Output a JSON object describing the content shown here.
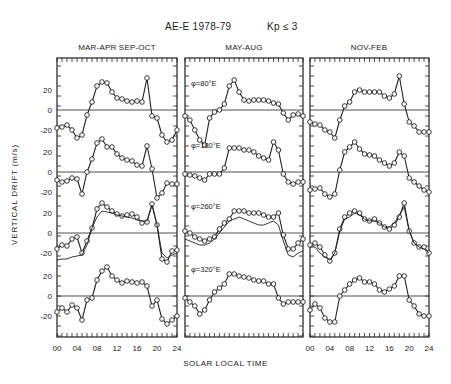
{
  "header": {
    "title_left": "AE-E 1978-79",
    "title_right": "Kp ≤ 3"
  },
  "axes": {
    "ylabel": "VERTICAL DRIFT (m/s)",
    "xlabel": "SOLAR LOCAL TIME",
    "x_ticks": [
      "00",
      "04",
      "08",
      "12",
      "16",
      "20",
      "24"
    ],
    "y_ticks": [
      "20",
      "0",
      "-20"
    ]
  },
  "chart_data": {
    "type": "line",
    "xlabel": "SOLAR LOCAL TIME",
    "ylabel": "VERTICAL DRIFT (m/s)",
    "x": [
      0,
      1,
      2,
      3,
      4,
      5,
      6,
      7,
      8,
      9,
      10,
      11,
      12,
      13,
      14,
      15,
      16,
      17,
      18,
      19,
      20,
      21,
      22,
      23,
      24
    ],
    "xlim": [
      0,
      24
    ],
    "grid": false,
    "layout": "3 columns (seasons) x 4 stacked traces (longitude sectors), each trace with its own zero line",
    "longitudes": [
      "φ=80°E",
      "φ=180°E",
      "φ=260°E",
      "φ=320°E"
    ],
    "panels": [
      {
        "season": "MAR-APR SEP-OCT",
        "series": [
          {
            "name": "φ=80°E",
            "values": [
              -18,
              -17,
              -15,
              -20,
              -28,
              -25,
              -5,
              8,
              24,
              28,
              27,
              18,
              12,
              11,
              9,
              8,
              9,
              8,
              32,
              -6,
              -8,
              -25,
              -32,
              -30,
              -20
            ]
          },
          {
            "name": "φ=180°E",
            "values": [
              -8,
              -10,
              -9,
              -6,
              -7,
              -22,
              0,
              13,
              29,
              33,
              25,
              25,
              18,
              14,
              12,
              11,
              7,
              6,
              26,
              3,
              -26,
              -21,
              -11,
              -12,
              -12
            ]
          },
          {
            "name": "φ=260°E",
            "values": [
              -16,
              -12,
              -13,
              -6,
              -4,
              -20,
              -8,
              5,
              24,
              30,
              26,
              22,
              19,
              17,
              18,
              19,
              16,
              10,
              11,
              29,
              8,
              -26,
              -29,
              -18,
              -17
            ]
          },
          {
            "name": "φ=260°E (model)",
            "values": [
              -27,
              -26,
              -26,
              -24,
              -23,
              -22,
              -12,
              5,
              16,
              22,
              21,
              20,
              18,
              17,
              16,
              15,
              13,
              12,
              12,
              28,
              8,
              -20,
              -25,
              -22,
              -20
            ]
          },
          {
            "name": "φ=320°E",
            "values": [
              -16,
              -12,
              -16,
              -9,
              -12,
              -24,
              -4,
              -2,
              16,
              25,
              29,
              20,
              16,
              13,
              15,
              14,
              13,
              14,
              10,
              -10,
              -4,
              -23,
              -28,
              -24,
              -20
            ]
          }
        ]
      },
      {
        "season": "MAY-AUG",
        "series": [
          {
            "name": "φ=80°E",
            "values": [
              -6,
              -10,
              -20,
              -30,
              -35,
              -8,
              -2,
              0,
              6,
              24,
              30,
              18,
              10,
              9,
              10,
              10,
              10,
              9,
              7,
              6,
              -3,
              -10,
              -5,
              -4,
              -6
            ]
          },
          {
            "name": "φ=180°E",
            "values": [
              -2,
              -3,
              -4,
              -6,
              -8,
              -2,
              -2,
              -2,
              4,
              24,
              24,
              24,
              22,
              22,
              20,
              16,
              14,
              12,
              30,
              22,
              -2,
              -10,
              -12,
              -10,
              -10
            ]
          },
          {
            "name": "φ=260°E",
            "values": [
              2,
              0,
              -4,
              -6,
              -8,
              -6,
              -4,
              4,
              10,
              14,
              22,
              22,
              22,
              20,
              20,
              20,
              18,
              16,
              16,
              20,
              -2,
              -16,
              -16,
              -10,
              -6
            ]
          },
          {
            "name": "φ=260°E (model)",
            "values": [
              -6,
              -8,
              -10,
              -12,
              -12,
              -10,
              -6,
              0,
              6,
              12,
              14,
              16,
              14,
              12,
              10,
              8,
              8,
              10,
              12,
              8,
              -8,
              -22,
              -24,
              -20,
              -18
            ]
          },
          {
            "name": "φ=320°E",
            "values": [
              -2,
              -6,
              -10,
              -18,
              -14,
              -4,
              4,
              8,
              12,
              22,
              22,
              20,
              19,
              18,
              16,
              15,
              15,
              12,
              12,
              -2,
              -8,
              -6,
              -6,
              -6,
              -6
            ]
          }
        ]
      },
      {
        "season": "NOV-FEB",
        "series": [
          {
            "name": "φ=80°E",
            "values": [
              -12,
              -14,
              -15,
              -20,
              -22,
              -28,
              -10,
              4,
              8,
              18,
              20,
              18,
              18,
              18,
              18,
              14,
              12,
              16,
              34,
              6,
              -12,
              -16,
              -22,
              -22,
              -22
            ]
          },
          {
            "name": "φ=180°E",
            "values": [
              -18,
              -17,
              -16,
              -22,
              -25,
              -22,
              2,
              20,
              25,
              30,
              23,
              18,
              17,
              16,
              12,
              9,
              6,
              9,
              20,
              16,
              -6,
              -10,
              -14,
              -18,
              -20
            ]
          },
          {
            "name": "φ=260°E",
            "values": [
              -12,
              -10,
              -14,
              -22,
              -28,
              -20,
              4,
              16,
              20,
              22,
              20,
              14,
              12,
              14,
              10,
              6,
              4,
              8,
              16,
              30,
              2,
              -10,
              -14,
              -14,
              -20
            ]
          },
          {
            "name": "φ=260°E (model)",
            "values": [
              -14,
              -14,
              -20,
              -24,
              -27,
              -20,
              2,
              14,
              16,
              20,
              18,
              14,
              12,
              12,
              10,
              6,
              6,
              10,
              18,
              26,
              2,
              -10,
              -14,
              -16,
              -20
            ]
          },
          {
            "name": "φ=320°E",
            "values": [
              -14,
              -8,
              -12,
              -22,
              -26,
              -26,
              0,
              6,
              12,
              16,
              18,
              14,
              14,
              12,
              6,
              4,
              7,
              10,
              20,
              20,
              -4,
              -10,
              -18,
              -20,
              -20
            ]
          }
        ]
      }
    ]
  }
}
